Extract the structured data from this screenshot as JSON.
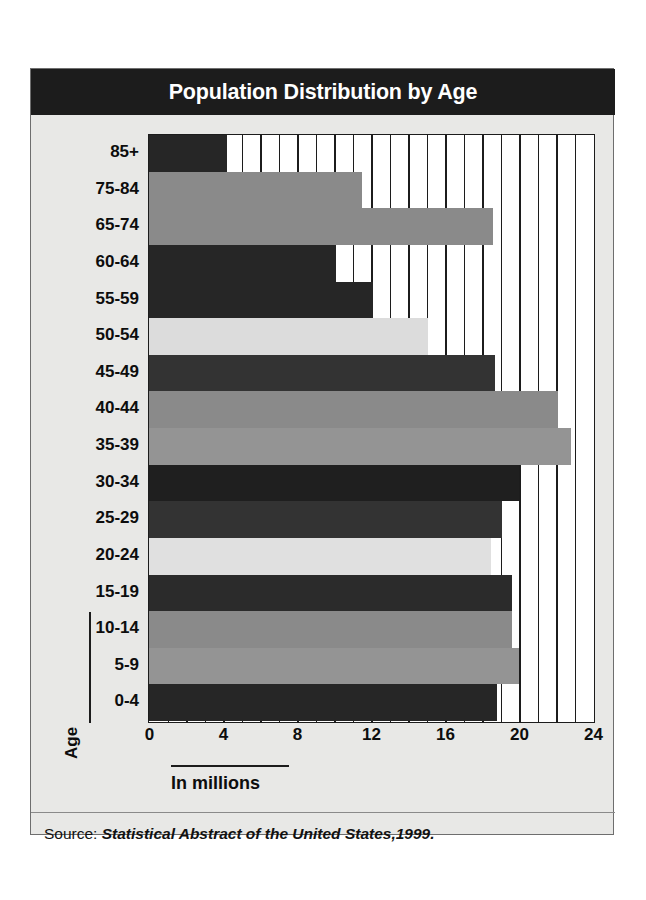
{
  "figure": {
    "title": "Population Distribution by Age",
    "source_label": "Source:",
    "source_title": "Statistical Abstract of the United States,1999.",
    "frame_bg": "#e8e8e6",
    "title_bar_bg": "#1c1c1c",
    "title_color": "#ffffff"
  },
  "chart_data": {
    "type": "bar",
    "orientation": "horizontal",
    "title": "Population Distribution by Age",
    "xlabel": "In millions",
    "ylabel": "Age",
    "xlim": [
      0,
      24
    ],
    "xticks": [
      0,
      4,
      8,
      12,
      16,
      20,
      24
    ],
    "xtick_labels": [
      "0",
      "4",
      "8",
      "12",
      "16",
      "20",
      "24"
    ],
    "grid": true,
    "grid_interval": 1,
    "legend": null,
    "categories": [
      "85+",
      "75-84",
      "65-74",
      "60-64",
      "55-59",
      "50-54",
      "45-49",
      "40-44",
      "35-39",
      "30-34",
      "25-29",
      "20-24",
      "15-19",
      "10-14",
      "5-9",
      "0-4"
    ],
    "values": [
      4.2,
      11.5,
      18.6,
      10.1,
      12.1,
      15.1,
      18.7,
      22.1,
      22.8,
      20.0,
      19.1,
      18.5,
      19.6,
      19.6,
      20.0,
      18.8
    ],
    "bar_colors": [
      "#262626",
      "#8a8a8a",
      "#8a8a8a",
      "#262626",
      "#262626",
      "#dcdcdc",
      "#333333",
      "#8a8a8a",
      "#949494",
      "#1f1f1f",
      "#333333",
      "#e0e0e0",
      "#2b2b2b",
      "#8a8a8a",
      "#949494",
      "#262626"
    ],
    "bars": [
      {
        "category": "85+",
        "value": 4.2,
        "color": "#262626"
      },
      {
        "category": "75-84",
        "value": 11.5,
        "color": "#8a8a8a"
      },
      {
        "category": "65-74",
        "value": 18.6,
        "color": "#8a8a8a"
      },
      {
        "category": "60-64",
        "value": 10.1,
        "color": "#262626"
      },
      {
        "category": "55-59",
        "value": 12.1,
        "color": "#262626"
      },
      {
        "category": "50-54",
        "value": 15.1,
        "color": "#dcdcdc"
      },
      {
        "category": "45-49",
        "value": 18.7,
        "color": "#333333"
      },
      {
        "category": "40-44",
        "value": 22.1,
        "color": "#8a8a8a"
      },
      {
        "category": "35-39",
        "value": 22.8,
        "color": "#949494"
      },
      {
        "category": "30-34",
        "value": 20.0,
        "color": "#1f1f1f"
      },
      {
        "category": "25-29",
        "value": 19.1,
        "color": "#333333"
      },
      {
        "category": "20-24",
        "value": 18.5,
        "color": "#e0e0e0"
      },
      {
        "category": "15-19",
        "value": 19.6,
        "color": "#2b2b2b"
      },
      {
        "category": "10-14",
        "value": 19.6,
        "color": "#8a8a8a"
      },
      {
        "category": "5-9",
        "value": 20.0,
        "color": "#949494"
      },
      {
        "category": "0-4",
        "value": 18.8,
        "color": "#262626"
      }
    ]
  }
}
